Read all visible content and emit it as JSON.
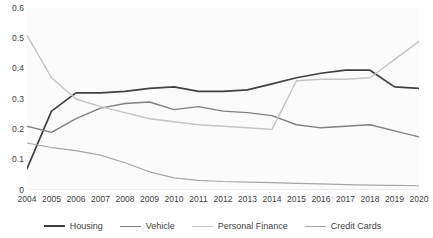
{
  "chart_data": {
    "type": "line",
    "title": "",
    "subtitle": "",
    "xlabel": "",
    "ylabel": "",
    "grid": false,
    "legend_position": "bottom",
    "x": [
      2004,
      2005,
      2006,
      2007,
      2008,
      2009,
      2010,
      2011,
      2012,
      2013,
      2014,
      2015,
      2016,
      2017,
      2018,
      2019,
      2020
    ],
    "categories": [
      "2004",
      "2005",
      "2006",
      "2007",
      "2008",
      "2009",
      "2010",
      "2011",
      "2012",
      "2013",
      "2014",
      "2015",
      "2016",
      "2017",
      "2018",
      "2019",
      "2020"
    ],
    "xlim": [
      2004,
      2020
    ],
    "ylim": [
      0,
      0.6
    ],
    "yticks": [
      0,
      0.1,
      0.2,
      0.3,
      0.4,
      0.5,
      0.6
    ],
    "ytick_labels": [
      "0",
      "0.1",
      "0.2",
      "0.3",
      "0.4",
      "0.5",
      "0.6"
    ],
    "series": [
      {
        "name": "Housing",
        "color": "#404040",
        "width": 1.7,
        "values": [
          0.07,
          0.26,
          0.32,
          0.32,
          0.325,
          0.335,
          0.34,
          0.325,
          0.325,
          0.33,
          0.35,
          0.37,
          0.385,
          0.395,
          0.395,
          0.34,
          0.335
        ]
      },
      {
        "name": "Vehicle",
        "color": "#808080",
        "width": 1.4,
        "values": [
          0.21,
          0.19,
          0.235,
          0.27,
          0.285,
          0.29,
          0.265,
          0.275,
          0.26,
          0.255,
          0.245,
          0.215,
          0.205,
          0.21,
          0.215,
          0.195,
          0.175
        ]
      },
      {
        "name": "Personal Finance",
        "color": "#c4c4c4",
        "width": 1.4,
        "values": [
          0.51,
          0.37,
          0.3,
          0.275,
          0.255,
          0.235,
          0.225,
          0.215,
          0.21,
          0.205,
          0.2,
          0.36,
          0.365,
          0.365,
          0.37,
          0.43,
          0.49
        ]
      },
      {
        "name": "Credit Cards",
        "color": "#a6a6a6",
        "width": 1.2,
        "values": [
          0.155,
          0.14,
          0.13,
          0.115,
          0.09,
          0.06,
          0.04,
          0.032,
          0.028,
          0.026,
          0.024,
          0.022,
          0.02,
          0.018,
          0.016,
          0.015,
          0.014
        ]
      }
    ]
  },
  "legend": {
    "items": [
      {
        "label": "Housing"
      },
      {
        "label": "Vehicle"
      },
      {
        "label": "Personal Finance"
      },
      {
        "label": "Credit Cards"
      }
    ]
  },
  "colors": {
    "background": "#ffffff",
    "plot_background": "#fbfbfb",
    "axis_text": "#404040"
  }
}
